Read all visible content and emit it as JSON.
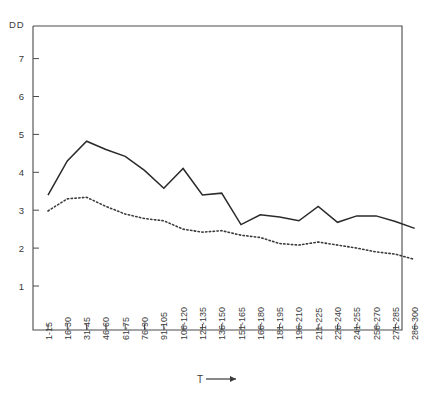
{
  "chart_data": {
    "type": "line",
    "title": "",
    "ylabel": "DD",
    "xlabel": "T",
    "xlabel_arrow": "⟶",
    "ylim": [
      0,
      8
    ],
    "yticks": [
      1,
      2,
      3,
      4,
      5,
      6,
      7
    ],
    "ytick_labels": [
      "1",
      "2",
      "3",
      "4",
      "5",
      "6",
      "7"
    ],
    "grid": false,
    "legend": "none",
    "categories": [
      "1-15",
      "16-30",
      "31-45",
      "46-60",
      "61-75",
      "76-90",
      "91-105",
      "106-120",
      "121-135",
      "136-150",
      "151-165",
      "166-180",
      "181-195",
      "196-210",
      "211-225",
      "226-240",
      "241-255",
      "256-270",
      "271-285",
      "286-300"
    ],
    "series": [
      {
        "name": "solid",
        "style": "solid",
        "color": "#2a2a2a",
        "values": [
          3.4,
          4.3,
          4.82,
          4.6,
          4.42,
          4.05,
          3.58,
          4.1,
          3.4,
          3.45,
          2.62,
          2.88,
          2.82,
          2.72,
          3.1,
          2.68,
          2.85,
          2.85,
          2.7,
          2.52
        ]
      },
      {
        "name": "dotted",
        "style": "dotted",
        "color": "#3a3a3a",
        "values": [
          2.98,
          3.3,
          3.34,
          3.1,
          2.9,
          2.78,
          2.72,
          2.5,
          2.42,
          2.46,
          2.34,
          2.28,
          2.12,
          2.08,
          2.16,
          2.08,
          2.0,
          1.9,
          1.84,
          1.7
        ]
      }
    ]
  },
  "axes": {
    "y_axis_corner_label": "DD",
    "x_axis_label": "T",
    "x_axis_arrow": "⟶"
  }
}
